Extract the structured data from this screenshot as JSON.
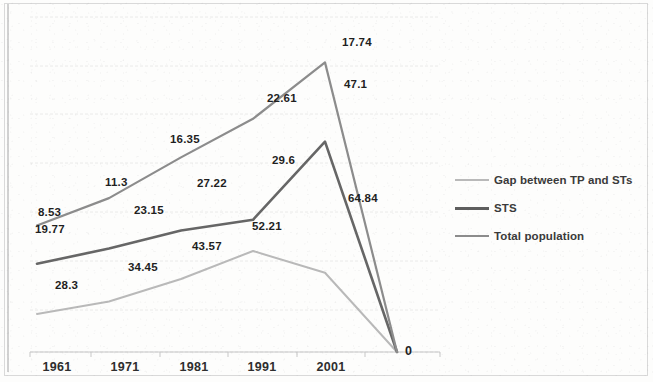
{
  "chart_data": {
    "type": "line",
    "title": "",
    "subtitle": "",
    "xlabel": "",
    "ylabel": "",
    "grid": true,
    "legend_position": "right",
    "categories": [
      "1961",
      "1971",
      "1981",
      "1991",
      "2001",
      ""
    ],
    "series": [
      {
        "name": "Gap between TP and STs",
        "color": "#b9b9b9",
        "width": 2,
        "values": [
          8.53,
          11.3,
          16.35,
          22.61,
          17.74,
          0
        ],
        "labels": [
          "8.53",
          "11.3",
          "16.35",
          "22.61",
          "17.74",
          ""
        ]
      },
      {
        "name": "STS",
        "color": "#666666",
        "width": 2.6,
        "values": [
          19.77,
          23.15,
          27.22,
          29.6,
          47.1,
          0
        ],
        "labels": [
          "19.77",
          "23.15",
          "27.22",
          "29.6",
          "47.1",
          ""
        ]
      },
      {
        "name": "Total population",
        "color": "#8c8c8c",
        "width": 2.2,
        "values": [
          28.3,
          34.45,
          43.57,
          52.21,
          64.84,
          0
        ],
        "labels": [
          "28.3",
          "34.45",
          "43.57",
          "52.21",
          "64.84",
          ""
        ]
      }
    ],
    "zero_label": "0",
    "gridline_color": "#e3e3e3",
    "axis_color": "#c7c7c7"
  },
  "legend": {
    "items": [
      {
        "label": "Gap between TP and STs",
        "color": "#b9b9b9",
        "thickness": "2px"
      },
      {
        "label": "STS",
        "color": "#5e5e5e",
        "thickness": "3px"
      },
      {
        "label": "Total population",
        "color": "#8c8c8c",
        "thickness": "2.4px"
      }
    ]
  },
  "xaxis": {
    "ticks": [
      {
        "label": "1961",
        "x": 57
      },
      {
        "label": "1971",
        "x": 125
      },
      {
        "label": "1981",
        "x": 194
      },
      {
        "label": "1991",
        "x": 262
      },
      {
        "label": "2001",
        "x": 331
      }
    ]
  },
  "data_labels": [
    {
      "text": "8.53",
      "x": 38,
      "y": 206,
      "series": "gap"
    },
    {
      "text": "11.3",
      "x": 105,
      "y": 176,
      "series": "gap"
    },
    {
      "text": "16.35",
      "x": 170,
      "y": 133,
      "series": "gap"
    },
    {
      "text": "22.61",
      "x": 267,
      "y": 92,
      "series": "gap"
    },
    {
      "text": "17.74",
      "x": 342,
      "y": 36,
      "series": "gap"
    },
    {
      "text": "19.77",
      "x": 35,
      "y": 223,
      "series": "sts"
    },
    {
      "text": "23.15",
      "x": 134,
      "y": 204,
      "series": "sts"
    },
    {
      "text": "27.22",
      "x": 197,
      "y": 177,
      "series": "sts"
    },
    {
      "text": "29.6",
      "x": 272,
      "y": 154,
      "series": "sts"
    },
    {
      "text": "47.1",
      "x": 344,
      "y": 78,
      "series": "sts"
    },
    {
      "text": "28.3",
      "x": 55,
      "y": 279,
      "series": "total"
    },
    {
      "text": "34.45",
      "x": 128,
      "y": 261,
      "series": "total"
    },
    {
      "text": "43.57",
      "x": 192,
      "y": 240,
      "series": "total"
    },
    {
      "text": "52.21",
      "x": 252,
      "y": 220,
      "series": "total"
    },
    {
      "text": "64.84",
      "x": 348,
      "y": 192,
      "series": "total"
    },
    {
      "text": "0",
      "x": 405,
      "y": 344,
      "series": "zero"
    }
  ]
}
